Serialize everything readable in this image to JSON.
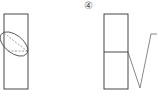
{
  "figures": [
    {
      "id": "figure-3-partial",
      "description": "Rectangle with tilted ellipse and dashed lines"
    },
    {
      "id": "figure-4",
      "label": "④",
      "description": "Rectangle split horizontally with V-shaped line to the right"
    }
  ],
  "colors": {
    "stroke": "#333333",
    "dashed": "#777777"
  }
}
